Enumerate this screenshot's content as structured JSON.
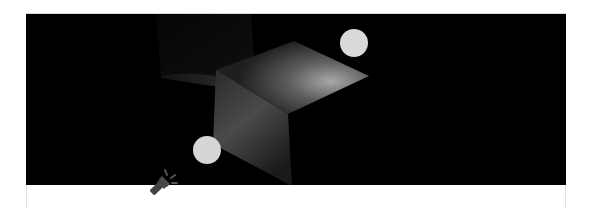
{
  "scene": {
    "background_color": "#000000",
    "card_border_color": "#e2e2e2",
    "lights": [
      {
        "id": "light-top-right",
        "cx": 328,
        "cy": 29,
        "r": 14,
        "color": "#d9d9d9"
      },
      {
        "id": "light-bottom-left",
        "cx": 181,
        "cy": 136,
        "r": 14,
        "color": "#d6d6d6"
      }
    ],
    "cube": {
      "top_face_color": "#5a5a5a",
      "top_face_highlight": "#9a9a9a",
      "front_face_color": "#3a3a3a",
      "shadow_color": "#1e1e1e"
    },
    "flashlight": {
      "icon": "flashlight-icon",
      "color": "#444444"
    }
  }
}
